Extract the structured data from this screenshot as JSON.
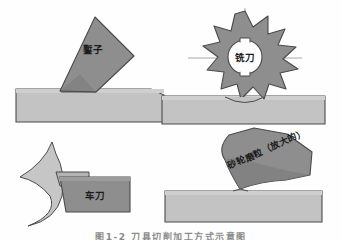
{
  "figure": {
    "caption": "图1-2 刀具切削加工方式示意图",
    "background_color": "#fefefe",
    "panels": [
      {
        "id": "chiseling",
        "position": "top-left",
        "tool_label": "鏨子",
        "tool_color": "#8e8e8e",
        "workpiece_color": "#c3c3c3",
        "outline_color": "#4a4a4a"
      },
      {
        "id": "milling",
        "position": "top-right",
        "tool_label": "铣刀",
        "tool_color": "#8e8e8e",
        "workpiece_color": "#c3c3c3",
        "outline_color": "#4a4a4a",
        "teeth_count": 9,
        "has_centerline": true
      },
      {
        "id": "turning",
        "position": "bottom-left",
        "tool_label": "车刀",
        "tool_color": "#8e8e8e",
        "chip_color": "#bfbfbf",
        "workpiece_color": "#c3c3c3",
        "outline_color": "#4a4a4a"
      },
      {
        "id": "grinding",
        "position": "bottom-right",
        "tool_label": "砂轮磨粒（放大的）",
        "tool_color": "#8e8e8e",
        "workpiece_color": "#c3c3c3",
        "outline_color": "#4a4a4a",
        "label_rotation_deg": -24
      }
    ]
  }
}
